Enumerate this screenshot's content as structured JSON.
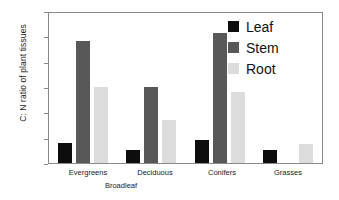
{
  "chart_data": {
    "type": "bar",
    "title": "",
    "xlabel": "",
    "ylabel": "C: N ratio of plant tissues",
    "categories": [
      "Evergreens",
      "Deciduous",
      "Conifers",
      "Grasses"
    ],
    "group_annotation": "Broadleaf",
    "series": [
      {
        "name": "Leaf",
        "color": "#0d0d0d",
        "values": [
          40,
          27,
          47,
          26
        ]
      },
      {
        "name": "Stem",
        "color": "#585858",
        "values": [
          245,
          152,
          261,
          0
        ]
      },
      {
        "name": "Root",
        "color": "#dcdcdc",
        "values": [
          152,
          86,
          142,
          38
        ]
      }
    ],
    "ylim": [
      0,
      300
    ],
    "yticks": [
      0,
      50,
      100,
      150,
      200,
      250,
      300
    ],
    "ytick_labels": [
      "0",
      "50",
      "100",
      "150",
      "200",
      "250",
      "300"
    ],
    "grid": false,
    "legend_position": "top-right"
  },
  "legend": {
    "entries": [
      {
        "label": "Leaf",
        "color": "#0d0d0d"
      },
      {
        "label": "Stem",
        "color": "#585858"
      },
      {
        "label": "Root",
        "color": "#dcdcdc"
      }
    ]
  },
  "axis": {
    "y_title": "C: N ratio of plant tissues",
    "y_labels": [
      "300",
      "250",
      "200",
      "150",
      "100",
      "50",
      "0"
    ],
    "x_labels": [
      "Evergreens",
      "Deciduous",
      "Conifers",
      "Grasses"
    ],
    "x_sublabel": "Broadleaf"
  }
}
